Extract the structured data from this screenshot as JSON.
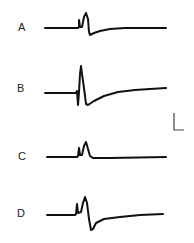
{
  "figure": {
    "panels": [
      {
        "label": "A",
        "label_x": 18,
        "label_y": 22,
        "path": "M45,28 L78,28 L79,27 L79,20 L80,27 L82,27 L84,17 L86,13 L88,19 L89,32 L90,35 L94,33 L100,31 L110,29 L125,28 L166,28"
      },
      {
        "label": "B",
        "label_x": 17,
        "label_y": 83,
        "path": "M45,93 L76,93 L77,91 L78,105 L79,92 L80,74 L81,66 L82,74 L84,88 L86,104 L88,105 L94,101 L104,96 L118,92 L135,90 L150,89 L166,88"
      },
      {
        "label": "C",
        "label_x": 18,
        "label_y": 151,
        "path": "M47,157 L77,157 L78,156 L79,148 L80,155 L82,155 L84,146 L86,142 L88,149 L90,156 L93,158 L110,158 L166,157"
      },
      {
        "label": "D",
        "label_x": 17,
        "label_y": 208,
        "path": "M47,215 L75,215 L76,214 L77,204 L78,213 L81,212 L83,203 L85,197 L87,203 L89,219 L91,230 L93,229 L96,223 L104,219 L120,217 L140,215 L163,214"
      }
    ],
    "scale_bar": {
      "path": "M174,113 L174,130 L184,130"
    }
  }
}
